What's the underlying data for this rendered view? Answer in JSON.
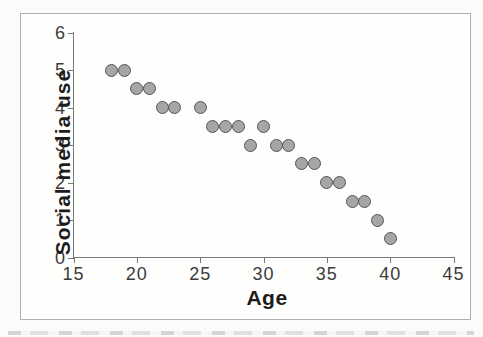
{
  "figure": {
    "x_axis_title": "Age",
    "y_axis_title": "Social media use"
  },
  "chart_data": {
    "type": "scatter",
    "title": "",
    "xlabel": "Age",
    "ylabel": "Social media use",
    "xlim": [
      15,
      45
    ],
    "ylim": [
      0,
      6
    ],
    "x_ticks": [
      15,
      20,
      25,
      30,
      35,
      40,
      45
    ],
    "y_ticks": [
      0,
      1,
      2,
      3,
      4,
      5,
      6
    ],
    "grid": false,
    "legend": false,
    "marker": {
      "shape": "circle",
      "diameter_px": 13
    },
    "points": [
      {
        "x": 18,
        "y": 5
      },
      {
        "x": 19,
        "y": 5
      },
      {
        "x": 20,
        "y": 4.5
      },
      {
        "x": 21,
        "y": 4.5
      },
      {
        "x": 22,
        "y": 4
      },
      {
        "x": 23,
        "y": 4
      },
      {
        "x": 25,
        "y": 4
      },
      {
        "x": 26,
        "y": 3.5
      },
      {
        "x": 27,
        "y": 3.5
      },
      {
        "x": 28,
        "y": 3.5
      },
      {
        "x": 29,
        "y": 3
      },
      {
        "x": 30,
        "y": 3.5
      },
      {
        "x": 31,
        "y": 3
      },
      {
        "x": 32,
        "y": 3
      },
      {
        "x": 33,
        "y": 2.5
      },
      {
        "x": 34,
        "y": 2.5
      },
      {
        "x": 35,
        "y": 2
      },
      {
        "x": 36,
        "y": 2
      },
      {
        "x": 37,
        "y": 1.5
      },
      {
        "x": 38,
        "y": 1.5
      },
      {
        "x": 39,
        "y": 1
      },
      {
        "x": 40,
        "y": 0.5
      }
    ]
  },
  "colors": {
    "background": "#fbfbfa",
    "frame_border": "#b1b0ae",
    "axis_line": "#787878",
    "tick_label": "#3c3c3c",
    "axis_title": "#1c1c1c",
    "point_fill": "#a6a6a6",
    "point_stroke": "#545454"
  }
}
